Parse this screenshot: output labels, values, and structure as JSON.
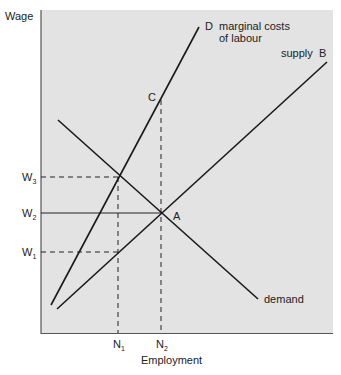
{
  "diagram": {
    "y_axis_label": "Wage",
    "x_axis_label": "Employment",
    "background_color": "#e3e3e3",
    "line_color": "#1a1a1a",
    "y_ticks": [
      {
        "label": "W",
        "sub": "3"
      },
      {
        "label": "W",
        "sub": "2"
      },
      {
        "label": "W",
        "sub": "1"
      }
    ],
    "x_ticks": [
      {
        "label": "N",
        "sub": "1"
      },
      {
        "label": "N",
        "sub": "2"
      }
    ],
    "curves": {
      "marginal_cost": {
        "letter": "D",
        "label_line1": "marginal costs",
        "label_line2": "of labour"
      },
      "supply": {
        "label": "supply",
        "letter": "B"
      },
      "demand": {
        "label": "demand"
      }
    },
    "points": {
      "A": "A",
      "C": "C"
    }
  }
}
